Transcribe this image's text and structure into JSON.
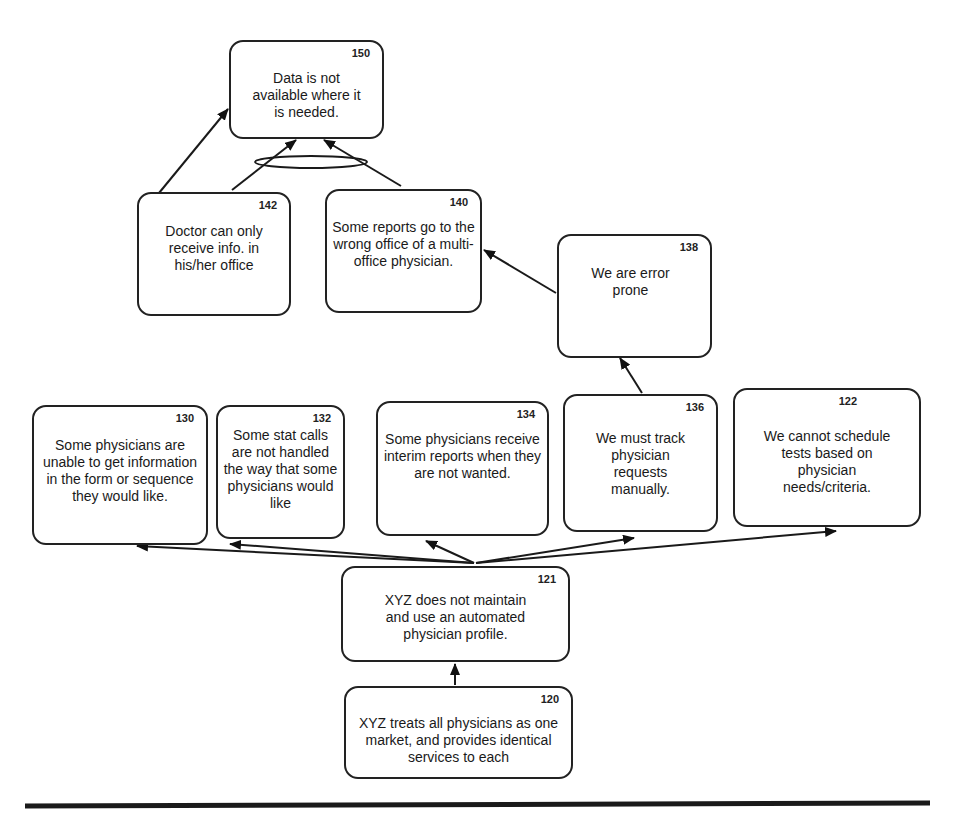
{
  "diagram": {
    "type": "current-reality-tree",
    "colors": {
      "stroke": "#222222",
      "background": "#ffffff",
      "text": "#1a1a1a"
    },
    "nodes": {
      "n150": {
        "id": "150",
        "text": "Data is not available where it is needed."
      },
      "n142": {
        "id": "142",
        "text": "Doctor can only receive info. in his/her office"
      },
      "n140": {
        "id": "140",
        "text": "Some reports go to the wrong office of a multi-office physician."
      },
      "n138": {
        "id": "138",
        "text": "We are error prone"
      },
      "n130": {
        "id": "130",
        "text": "Some physicians are unable to get information in the form or sequence they would like."
      },
      "n132": {
        "id": "132",
        "text": "Some stat calls are not handled the way that some physicians would like"
      },
      "n134": {
        "id": "134",
        "text": "Some physicians receive interim reports when they are not wanted."
      },
      "n136": {
        "id": "136",
        "text": "We must track physician requests manually."
      },
      "n122": {
        "id": "122",
        "text": "We cannot schedule tests based on physician needs/criteria."
      },
      "n121": {
        "id": "121",
        "text": "XYZ does not maintain and use an automated physician profile."
      },
      "n120": {
        "id": "120",
        "text": "XYZ treats all physicians as one market, and provides identical services to each"
      }
    },
    "edges": [
      {
        "from": "120",
        "to": "121"
      },
      {
        "from": "121",
        "to": "130"
      },
      {
        "from": "121",
        "to": "132"
      },
      {
        "from": "121",
        "to": "134"
      },
      {
        "from": "121",
        "to": "136"
      },
      {
        "from": "121",
        "to": "122"
      },
      {
        "from": "136",
        "to": "138"
      },
      {
        "from": "138",
        "to": "140"
      },
      {
        "from": "142",
        "to": "150"
      },
      {
        "from": "142",
        "to": "150",
        "and_group": "A"
      },
      {
        "from": "140",
        "to": "150",
        "and_group": "A"
      }
    ]
  }
}
